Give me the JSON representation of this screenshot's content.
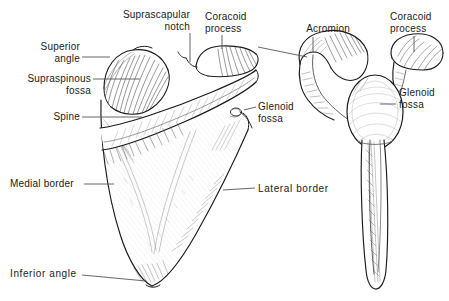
{
  "figure": {
    "background_color": "#ffffff",
    "ink_color": "#1a1a1a",
    "leader_color": "#55555a",
    "shade_color": "#6b6b70"
  },
  "labels": {
    "superior_angle": "Superior\nangle",
    "suprascapular_notch": "Suprascapular\nnotch",
    "coracoid_process_left": "Coracoid\nprocess",
    "acromion": "Acromion",
    "coracoid_process_right": "Coracoid\nprocess",
    "supraspinous_fossa": "Supraspinous\nfossa",
    "spine": "Spine",
    "glenoid_fossa_left": "Glenoid\nfossa",
    "glenoid_fossa_right": "Glenoid\nfossa",
    "medial_border": "Medial border",
    "lateral_border": "Lateral border",
    "inferior_angle": "Inferior angle"
  },
  "views": {
    "posterior": {
      "name": "posterior-scapula-view"
    },
    "lateral": {
      "name": "lateral-scapula-view"
    }
  }
}
